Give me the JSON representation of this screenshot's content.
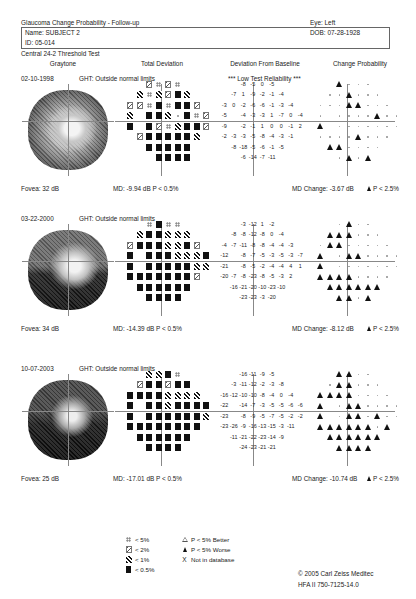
{
  "header": {
    "title": "Glaucoma Change Probability - Follow-up",
    "eye": "Eye: Left",
    "name": "Name: SUBJECT 2",
    "id": "ID: 05-014",
    "dob": "DOB: 07-28-1928",
    "test": "Central 24-2 Threshold Test"
  },
  "columns": [
    "Graytone",
    "Total Deviation",
    "Deviation From Baseline",
    "Change Probability"
  ],
  "sections": [
    {
      "date": "02-10-1998",
      "ght": "GHT: Outside normal limits",
      "reliability": "*** Low Test Reliability ***",
      "fovea": "Fovea: 32 dB",
      "md": "MD:  -9.94 dB  P < 0.5%",
      "md_change": "MD Change:  -3.67 dB",
      "change_p": "P < 2.5%",
      "total_deviation": [
        [
          "",
          "",
          "",
          "2",
          "5",
          "2",
          "5",
          "",
          "",
          ""
        ],
        [
          "",
          "",
          "1",
          "5",
          "1",
          "2",
          "S",
          "1",
          "",
          ""
        ],
        [
          "",
          "2",
          "2",
          "5",
          "S",
          "5",
          "S",
          "S",
          "2",
          ""
        ],
        [
          "",
          "1",
          "",
          "S",
          "S",
          "1",
          ".",
          "S",
          "5",
          "2"
        ],
        [
          "",
          "S",
          "",
          "S",
          "2",
          "5",
          "1",
          "S",
          "S",
          "2"
        ],
        [
          "",
          "",
          "2",
          "S",
          "S",
          "S",
          "S",
          "S",
          "1",
          ""
        ],
        [
          "",
          "",
          "",
          "S",
          "S",
          "S",
          "S",
          "S",
          "",
          ""
        ],
        [
          "",
          "",
          "",
          "",
          "S",
          "S",
          "S",
          "S",
          "",
          ""
        ]
      ],
      "deviation_from_baseline": [
        [
          "",
          "",
          "",
          "-8",
          "-5",
          "0",
          "-5",
          "",
          "",
          ""
        ],
        [
          "",
          "",
          "-7",
          "1",
          "-9",
          "-2",
          "-1",
          "-4",
          "",
          ""
        ],
        [
          "",
          "-3",
          "0",
          "-2",
          "-6",
          "-6",
          "-1",
          "-3",
          "-4",
          ""
        ],
        [
          "",
          "-5",
          "",
          "-4",
          "-3",
          "-3",
          "1",
          "-7",
          "0",
          "-4"
        ],
        [
          "",
          "-9",
          "",
          "-2",
          "-1",
          "1",
          "0",
          "0",
          "-1",
          "2"
        ],
        [
          "",
          "-2",
          "-3",
          "-3",
          "-5",
          "-8",
          "-4",
          "-3",
          "-1",
          ""
        ],
        [
          "",
          "",
          "-8",
          "-18",
          "-5",
          "-6",
          "-1",
          "-5",
          "",
          ""
        ],
        [
          "",
          "",
          "",
          "-6",
          "-14",
          "-7",
          "-11",
          "",
          "",
          ""
        ]
      ],
      "change_probability": [
        [
          "",
          "",
          "",
          "T",
          ".",
          ".",
          ".",
          "",
          "",
          ""
        ],
        [
          "",
          "",
          ".",
          ".",
          "T",
          ".",
          ".",
          ".",
          "",
          ""
        ],
        [
          "",
          ".",
          ".",
          ".",
          "T",
          "T",
          ".",
          ".",
          ".",
          ""
        ],
        [
          "",
          ".",
          "",
          ".",
          ".",
          ".",
          ".",
          "T",
          ".",
          "."
        ],
        [
          "",
          "T",
          "",
          ".",
          ".",
          ".",
          ".",
          ".",
          ".",
          "."
        ],
        [
          "",
          ".",
          ".",
          ".",
          ".",
          "T",
          ".",
          ".",
          ".",
          ""
        ],
        [
          "",
          "",
          "T",
          "T",
          ".",
          ".",
          ".",
          ".",
          "",
          ""
        ],
        [
          "",
          "",
          "",
          ".",
          "T",
          ".",
          "T",
          "",
          "",
          ""
        ]
      ]
    },
    {
      "date": "03-22-2000",
      "ght": "GHT: Outside normal limits",
      "reliability": "",
      "fovea": "Fovea: 34 dB",
      "md": "MD:  -14.39 dB  P < 0.5%",
      "md_change": "MD Change:  -8.12 dB",
      "change_p": "P < 2.5%",
      "total_deviation": [
        [
          "",
          "",
          "",
          "5",
          "S",
          "5",
          "5",
          "",
          "",
          ""
        ],
        [
          "",
          "",
          "1",
          "S",
          "S",
          "1",
          "1",
          "1",
          "",
          ""
        ],
        [
          "",
          "2",
          "S",
          "S",
          "S",
          "1",
          "1",
          "S",
          "2",
          ""
        ],
        [
          "",
          "S",
          "",
          "S",
          "S",
          "S",
          "1",
          "1",
          "1",
          "S"
        ],
        [
          "",
          "S",
          "",
          "S",
          "S",
          "S",
          "S",
          "S",
          "1",
          "1"
        ],
        [
          "",
          "S",
          "S",
          "S",
          "S",
          "S",
          "S",
          "S",
          "2",
          ""
        ],
        [
          "",
          "",
          "S",
          "S",
          "S",
          "S",
          "S",
          "S",
          "",
          ""
        ],
        [
          "",
          "",
          "",
          "S",
          "S",
          "S",
          "S",
          "",
          "",
          ""
        ]
      ],
      "deviation_from_baseline": [
        [
          "",
          "",
          "",
          "-3",
          "-12",
          "1",
          "-2",
          "",
          "",
          ""
        ],
        [
          "",
          "",
          "-8",
          "-8",
          "-12",
          "-8",
          "0",
          "-4",
          "",
          ""
        ],
        [
          "",
          "-4",
          "-7",
          "-11",
          "-8",
          "-8",
          "-4",
          "-4",
          "-3",
          ""
        ],
        [
          "",
          "-12",
          "",
          "-8",
          "-7",
          "-5",
          "-3",
          "-5",
          "-3",
          "-7"
        ],
        [
          "",
          "-21",
          "",
          "-8",
          "-5",
          "-2",
          "-4",
          "-4",
          "4",
          "1"
        ],
        [
          "",
          "-20",
          "-7",
          "-8",
          "-23",
          "-8",
          "-5",
          "-3",
          "2",
          ""
        ],
        [
          "",
          "",
          "-16",
          "-21",
          "-20",
          "-10",
          "-23",
          "-10",
          "",
          ""
        ],
        [
          "",
          "",
          "",
          "-23",
          "-23",
          "-3",
          "-20",
          "",
          "",
          ""
        ]
      ],
      "change_probability": [
        [
          "",
          "",
          "",
          ".",
          "T",
          ".",
          ".",
          "",
          "",
          ""
        ],
        [
          "",
          "",
          "T",
          "T",
          "T",
          ".",
          ".",
          ".",
          "",
          ""
        ],
        [
          "",
          ".",
          "T",
          "T",
          ".",
          ".",
          ".",
          ".",
          ".",
          ""
        ],
        [
          "",
          "T",
          "",
          ".",
          "T",
          "T",
          ".",
          ".",
          ".",
          "."
        ],
        [
          "",
          "T",
          "",
          ".",
          ".",
          ".",
          ".",
          ".",
          ".",
          "."
        ],
        [
          "",
          "T",
          "T",
          "T",
          "T",
          ".",
          ".",
          ".",
          ".",
          ""
        ],
        [
          "",
          "",
          "T",
          "T",
          "T",
          "T",
          "T",
          "T",
          "",
          ""
        ],
        [
          "",
          "",
          "",
          "T",
          "T",
          ".",
          "T",
          "",
          "",
          ""
        ]
      ]
    },
    {
      "date": "10-07-2003",
      "ght": "GHT: Outside normal limits",
      "reliability": "",
      "fovea": "Fovea: 25 dB",
      "md": "MD:  -17.01 dB  P < 0.5%",
      "md_change": "MD Change:  -10.74 dB",
      "change_p": "P < 2.5%",
      "total_deviation": [
        [
          "",
          "",
          "",
          "1",
          "1",
          "S",
          "5",
          "",
          "",
          ""
        ],
        [
          "",
          "",
          "2",
          "S",
          "S",
          "2",
          "S",
          "S",
          "",
          ""
        ],
        [
          "",
          "S",
          "S",
          "S",
          "S",
          "1",
          "1",
          "1",
          "1",
          ""
        ],
        [
          "",
          "S",
          "",
          "S",
          "S",
          "1",
          "S",
          "S",
          "S",
          "S"
        ],
        [
          "",
          "S",
          "",
          "S",
          "S",
          "S",
          "S",
          "S",
          "S",
          "1"
        ],
        [
          "",
          "S",
          "S",
          "S",
          "S",
          "S",
          "S",
          "S",
          "S",
          ""
        ],
        [
          "",
          "",
          "S",
          "S",
          "S",
          "S",
          "S",
          "S",
          "",
          ""
        ],
        [
          "",
          "",
          "",
          "S",
          "S",
          "S",
          "S",
          "",
          "",
          ""
        ]
      ],
      "deviation_from_baseline": [
        [
          "",
          "",
          "",
          "-16",
          "-11",
          "-9",
          "-5",
          "",
          "",
          ""
        ],
        [
          "",
          "",
          "-3",
          "-11",
          "-12",
          "-2",
          "-3",
          "-8",
          "",
          ""
        ],
        [
          "",
          "-16",
          "-12",
          "-10",
          "-10",
          "-8",
          "-4",
          "0",
          "-4",
          ""
        ],
        [
          "",
          "-22",
          "",
          "-14",
          "-7",
          "-3",
          "-5",
          "-5",
          "-6",
          "-6"
        ],
        [
          "",
          "-23",
          "",
          "-8",
          "-9",
          "-5",
          "-7",
          "-5",
          "-2",
          "-2"
        ],
        [
          "",
          "-23",
          "-26",
          "-9",
          "-16",
          "-13",
          "-15",
          "-3",
          "-11",
          ""
        ],
        [
          "",
          "",
          "-11",
          "-21",
          "-22",
          "-23",
          "-14",
          "-9",
          "",
          ""
        ],
        [
          "",
          "",
          "",
          "-24",
          "-23",
          "-21",
          "-21",
          "",
          "",
          ""
        ]
      ],
      "change_probability": [
        [
          "",
          "",
          "",
          "T",
          "T",
          ".",
          ".",
          "",
          "",
          ""
        ],
        [
          "",
          "",
          ".",
          "T",
          "T",
          ".",
          ".",
          ".",
          "",
          ""
        ],
        [
          "",
          "T",
          "T",
          "T",
          "T",
          ".",
          ".",
          ".",
          ".",
          ""
        ],
        [
          "",
          "T",
          "",
          ".",
          "T",
          "T",
          ".",
          ".",
          ".",
          "."
        ],
        [
          "",
          "T",
          "",
          ".",
          "T",
          "T",
          ".",
          "T",
          ".",
          "."
        ],
        [
          "",
          "T",
          "T",
          "T",
          "T",
          "T",
          "T",
          ".",
          "T",
          ""
        ],
        [
          "",
          "",
          "T",
          "T",
          "T",
          "T",
          "T",
          "T",
          "",
          ""
        ],
        [
          "",
          "",
          "",
          "T",
          "T",
          "T",
          "T",
          "",
          "",
          ""
        ]
      ]
    }
  ],
  "legend": {
    "left": [
      {
        "icon": "dots-icon",
        "label": "< 5%"
      },
      {
        "icon": "hatch-light-icon",
        "label": "< 2%"
      },
      {
        "icon": "hatch-dark-icon",
        "label": "< 1%"
      },
      {
        "icon": "solid-square-icon",
        "label": "< 0.5%"
      }
    ],
    "right": [
      {
        "icon": "open-triangle-icon",
        "label": "P < 5% Better"
      },
      {
        "icon": "filled-triangle-icon",
        "label": "P < 5% Worse"
      },
      {
        "icon": "x-icon",
        "label": "Not in database"
      }
    ]
  },
  "footer": {
    "copyright": "© 2005 Carl Zeiss Meditec",
    "model": "HFA II 750-7125-14.0"
  }
}
